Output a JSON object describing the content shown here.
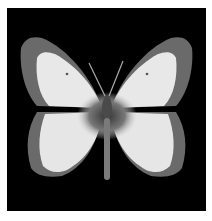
{
  "image": {
    "subject": "butterfly specimen",
    "background_color": "#000000",
    "border_color": "#ffffff",
    "wing_color": "#e8e8e8",
    "margin_color": "#6a6a6a",
    "body_color": "#4a4a4a"
  }
}
